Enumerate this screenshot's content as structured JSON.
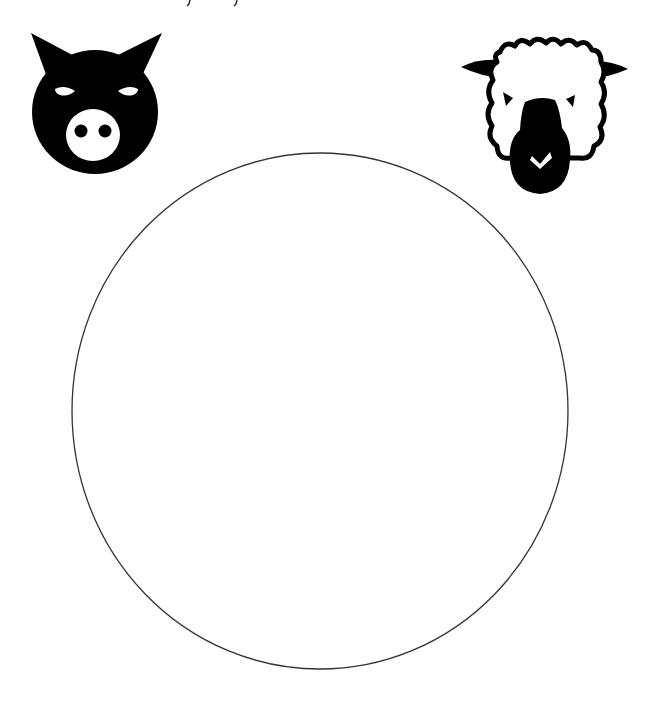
{
  "worksheet": {
    "header_text_cut_off": true,
    "animals": [
      {
        "name": "pig",
        "position": "top-left"
      },
      {
        "name": "sheep",
        "position": "top-right"
      }
    ],
    "drawing_area": {
      "shape": "circle",
      "stroke": "#333333",
      "fill": "#ffffff"
    }
  },
  "colors": {
    "ink": "#000000",
    "paper": "#ffffff",
    "circle_stroke": "#333333"
  }
}
